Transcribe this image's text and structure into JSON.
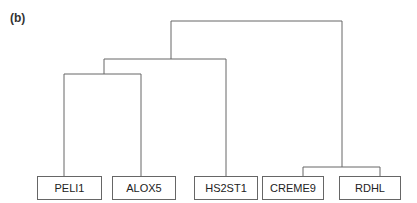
{
  "panel_label": "(b)",
  "diagram": {
    "type": "dendrogram",
    "leaves": [
      {
        "label": "PELI1",
        "x": 37,
        "w": 65
      },
      {
        "label": "ALOX5",
        "x": 112,
        "w": 64
      },
      {
        "label": "HS2ST1",
        "x": 194,
        "w": 64
      },
      {
        "label": "CREME9",
        "x": 262,
        "w": 62
      },
      {
        "label": "RDHL",
        "x": 339,
        "w": 62
      }
    ],
    "clusters": [
      {
        "members": [
          "PELI1",
          "ALOX5"
        ]
      },
      {
        "members": [
          "PELI1",
          "ALOX5",
          "HS2ST1"
        ]
      },
      {
        "members": [
          "CREME9",
          "RDHL"
        ]
      },
      {
        "members": [
          "PELI1",
          "ALOX5",
          "HS2ST1",
          "CREME9",
          "RDHL"
        ]
      }
    ],
    "line_color": "#666666"
  }
}
